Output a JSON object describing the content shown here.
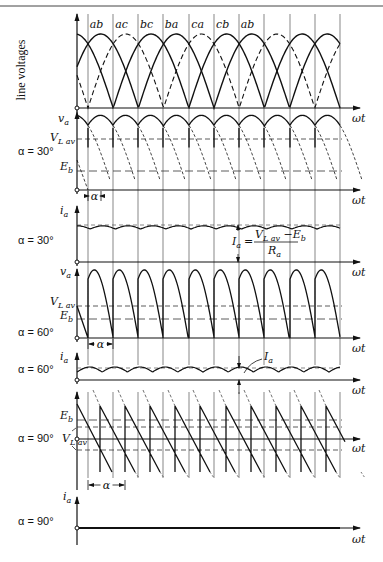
{
  "figure": {
    "top_rule_y": 6,
    "axis_x": 77,
    "axis_end_x": 360,
    "grid_x": [
      88,
      113,
      138,
      163,
      189,
      214,
      239,
      264,
      290,
      315,
      340
    ],
    "omega_t_label": "ωt"
  },
  "panels": {
    "line_voltages": {
      "ylabel": "line voltages",
      "axis_y": 108,
      "peak_y": 34,
      "segment_labels": [
        "ab",
        "ac",
        "bc",
        "ba",
        "ca",
        "cb",
        "ab"
      ]
    },
    "va_30": {
      "ylabel": "v",
      "ylabel_sub": "a",
      "alpha_label": "α = 30°",
      "axis_y": 190,
      "top_y": 124,
      "vlav_label": "V",
      "vlav_sub": "L av",
      "vlav_y": 139,
      "eb_label": "E",
      "eb_sub": "b",
      "eb_y": 171,
      "alpha_marker": "α"
    },
    "ia_30": {
      "ylabel": "i",
      "ylabel_sub": "a",
      "alpha_label": "α = 30°",
      "axis_y": 262,
      "mean_y": 225,
      "formula_lhs": "I",
      "formula_lhs_sub": "a",
      "formula_num": "V",
      "formula_num_sub": "L av",
      "formula_num_rest": " −E",
      "formula_num_rest_sub": "b",
      "formula_den": "R",
      "formula_den_sub": "a"
    },
    "va_60": {
      "ylabel": "v",
      "ylabel_sub": "a",
      "alpha_label": "α = 60°",
      "axis_y": 338,
      "top_y": 279,
      "vlav_label": "V",
      "vlav_sub": "L av",
      "vlav_y": 306,
      "eb_label": "E",
      "eb_sub": "b",
      "eb_y": 319,
      "alpha_marker": "α"
    },
    "ia_60": {
      "ylabel": "i",
      "ylabel_sub": "a",
      "alpha_label": "α = 60°",
      "axis_y": 380,
      "mean_y": 368,
      "ia_label": "I",
      "ia_sub": "a"
    },
    "va_90": {
      "alpha_label": "α = 90°",
      "axis_y": 439,
      "top_y": 404,
      "bottom_y": 472,
      "eb_label": "E",
      "eb_sub": "b",
      "eb_y": 420,
      "vlav_label": "V",
      "vlav_sub": "L av",
      "vlav_upper_y": 427,
      "vlav_lower_y": 450,
      "alpha_marker": "α"
    },
    "ia_90": {
      "ylabel": "i",
      "ylabel_sub": "a",
      "alpha_label": "α = 90°",
      "axis_y": 528
    }
  },
  "chart_data": {
    "type": "line",
    "xlabel": "ωt",
    "panels": [
      {
        "name": "line voltages",
        "series": [
          "ab",
          "ac",
          "bc",
          "ba",
          "ca",
          "cb",
          "ab"
        ]
      },
      {
        "name": "v_a",
        "alpha": "30°",
        "levels": [
          "V_L av",
          "E_b"
        ]
      },
      {
        "name": "i_a",
        "alpha": "30°",
        "annotation": "I_a = (V_L av − E_b) / R_a"
      },
      {
        "name": "v_a",
        "alpha": "60°",
        "levels": [
          "V_L av",
          "E_b"
        ]
      },
      {
        "name": "i_a",
        "alpha": "60°",
        "annotation": "I_a"
      },
      {
        "name": "v_a",
        "alpha": "90°",
        "levels": [
          "E_b",
          "V_L av"
        ]
      },
      {
        "name": "i_a",
        "alpha": "90°",
        "annotation": "zero current"
      }
    ]
  }
}
